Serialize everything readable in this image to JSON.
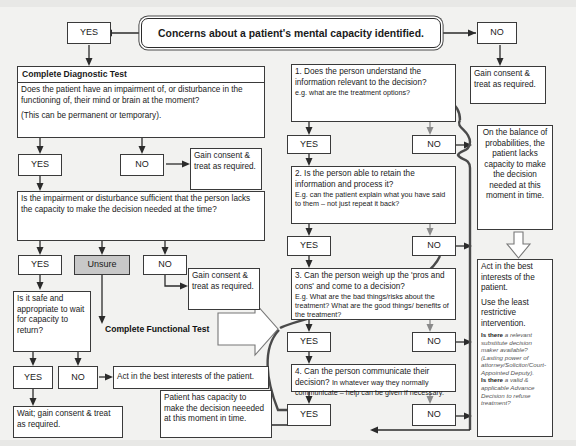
{
  "title": {
    "text": "Concerns about a patient's mental capacity identified."
  },
  "labels": {
    "yes": "YES",
    "no": "NO",
    "unsure": "Unsure"
  },
  "banners": {
    "functional_test": "Complete Functional Test"
  },
  "left_branch": {
    "diagnostic_header": "Complete Diagnostic Test",
    "diagnostic_question": "Does the patient have  an impairment of, or disturbance in the functioning of, their mind or brain at the moment?",
    "diagnostic_note": "(This can be permanent or temporary).",
    "yes_1": "YES",
    "no_1": "NO",
    "gain_consent_1": "Gain consent & treat as required.",
    "impairment_question": "Is the impairment or disturbance sufficient that the person lacks the capacity to make the decision needed at the time?",
    "yes_2": "YES",
    "unsure_2": "Unsure",
    "no_2": "NO",
    "gain_consent_2": "Gain consent & treat as required.",
    "safe_question": "Is it safe and appropriate to wait for capacity to return?",
    "yes_3": "YES",
    "no_3": "NO",
    "best_interests": "Act in the best interests of the patient.",
    "wait_outcome": "Wait; gain consent & treat as required."
  },
  "functional_test": {
    "q1": {
      "text": "1. Does the person understand the information relevant to the decision?",
      "example": "e.g. what are the treatment options?",
      "yes": "YES",
      "no": "NO"
    },
    "q2": {
      "text": "2. Is the person able to retain the information and process it?",
      "example": "E.g. can the patient explain what you have said to them – not just repeat it back?",
      "yes": "YES",
      "no": "NO"
    },
    "q3": {
      "text": "3. Can the person weigh up the 'pros and cons' and come to a decision?",
      "example": "E.g. What are the bad things/risks about the treatment? What are the good things/ benefits of the treatment?",
      "yes": "YES",
      "no": "NO"
    },
    "q4": {
      "text": "4. Can the person communicate their decision?",
      "example": "In whatever way they normally communicate – help can be given if necessary.",
      "yes": "YES",
      "no": "NO"
    }
  },
  "right_branch": {
    "no_top": "NO",
    "gain_consent": "Gain consent & treat as required.",
    "lacks_capacity": "On the balance of probabilities, the patient lacks capacity to make the decision needed at this moment in time.",
    "best_interests_heading": "Act in the best interests of the patient.",
    "least_restrictive": "Use the least restrictive intervention.",
    "note_1_bold": "Is there",
    "note_1_rest": " a relevant substitute decision maker available? (Lasting power of attorney/Solicitor/Court-Appointed Deputy).",
    "note_2_bold": "Is there",
    "note_2_rest": " a valid & applicable Advance Decision to refuse treatment?"
  },
  "outcome": {
    "has_capacity": "Patient has capacity to make the decision neeeded at this moment in time."
  },
  "colors": {
    "background": "#f2f2f0",
    "box_border": "#3a3a3a",
    "unsure_fill": "#c8c8c8",
    "line": "#2b2b2b",
    "grey_line": "#8a8a8a"
  }
}
